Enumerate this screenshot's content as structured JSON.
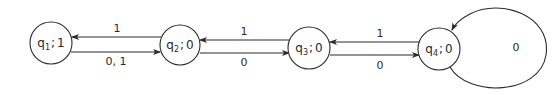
{
  "diagram": {
    "type": "state-machine",
    "states": [
      {
        "id": "q1",
        "name": "q",
        "sub": "1",
        "sep": ";",
        "output": "1",
        "cx": 51,
        "cy": 43,
        "r": 21
      },
      {
        "id": "q2",
        "name": "q",
        "sub": "2",
        "sep": ";",
        "output": "0",
        "cx": 180,
        "cy": 45,
        "r": 20
      },
      {
        "id": "q3",
        "name": "q",
        "sub": "3",
        "sep": ";",
        "output": "0",
        "cx": 309,
        "cy": 48,
        "r": 21
      },
      {
        "id": "q4",
        "name": "q",
        "sub": "4",
        "sep": ";",
        "output": "0",
        "cx": 439,
        "cy": 49,
        "r": 21
      }
    ],
    "transitions": [
      {
        "from": "q2",
        "to": "q1",
        "label": "1"
      },
      {
        "from": "q1",
        "to": "q2",
        "label": "0, 1"
      },
      {
        "from": "q3",
        "to": "q2",
        "label": "1"
      },
      {
        "from": "q2",
        "to": "q3",
        "label": "0"
      },
      {
        "from": "q4",
        "to": "q3",
        "label": "1"
      },
      {
        "from": "q3",
        "to": "q4",
        "label": "0"
      },
      {
        "from": "q4",
        "to": "q4",
        "label": "0"
      }
    ]
  }
}
